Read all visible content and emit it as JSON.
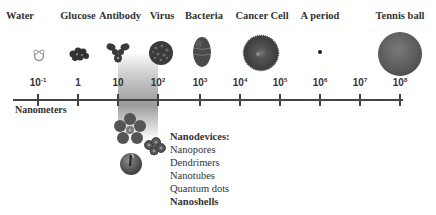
{
  "diagram": {
    "title_items": [
      {
        "label": "Water",
        "x": 20
      },
      {
        "label": "Glucose",
        "x": 78
      },
      {
        "label": "Antibody",
        "x": 120
      },
      {
        "label": "Virus",
        "x": 162
      },
      {
        "label": "Bacteria",
        "x": 204
      },
      {
        "label": "Cancer Cell",
        "x": 262
      },
      {
        "label": "A period",
        "x": 320
      },
      {
        "label": "Tennis ball",
        "x": 400
      }
    ],
    "scale": {
      "unit_label": "Nanometers",
      "ticks": [
        {
          "base": "10",
          "exp": "-1",
          "x": 38
        },
        {
          "base": "1",
          "exp": "",
          "x": 78
        },
        {
          "base": "10",
          "exp": "",
          "x": 118
        },
        {
          "base": "10",
          "exp": "2",
          "x": 158
        },
        {
          "base": "10",
          "exp": "3",
          "x": 200
        },
        {
          "base": "10",
          "exp": "4",
          "x": 240
        },
        {
          "base": "10",
          "exp": "5",
          "x": 280
        },
        {
          "base": "10",
          "exp": "6",
          "x": 320
        },
        {
          "base": "10",
          "exp": "7",
          "x": 360
        },
        {
          "base": "10",
          "exp": "8",
          "x": 400
        }
      ]
    },
    "nanodevices": {
      "title": "Nanodevices:",
      "items": [
        "Nanopores",
        "Dendrimers",
        "Nanotubes",
        "Quantum dots",
        "Nanoshells"
      ]
    },
    "icons": [
      "water-molecule-icon",
      "glucose-molecule-icon",
      "antibody-icon",
      "virus-icon",
      "bacteria-icon",
      "cancer-cell-icon",
      "period-dot-icon",
      "tennis-ball-icon",
      "dendrimer-flower-icon",
      "nanoshell-chain-icon",
      "nanopore-sphere-icon"
    ],
    "colors": {
      "text": "#333333",
      "axis": "#444444",
      "objects": "#555555",
      "band_dark": "#9a9a9a"
    }
  }
}
